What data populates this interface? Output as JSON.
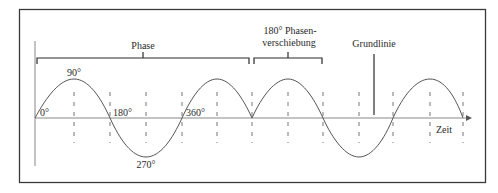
{
  "figure": {
    "type": "sine wave phase diagram",
    "colors": {
      "frame": "#3a3a3a",
      "wave": "#555555",
      "dash": "#666666",
      "text": "#2a2a2a",
      "background": "#ffffff"
    },
    "labels": {
      "phase": "Phase",
      "phase_shift_line1": "180° Phasen-",
      "phase_shift_line2": "verschiebung",
      "baseline": "Grundlinie",
      "time_axis": "Zeit",
      "deg_0": "0°",
      "deg_90": "90°",
      "deg_180": "180°",
      "deg_270": "270°",
      "deg_360": "360°"
    },
    "waves": [
      {
        "name": "first wave",
        "phase_start_deg": 0,
        "cycles": 1.25
      },
      {
        "name": "phase-shifted wave",
        "phase_offset_deg": 180,
        "cycles": 1.5
      }
    ],
    "dashed_marks_x": [
      74,
      110,
      146,
      182,
      217,
      252,
      288,
      323,
      359,
      393,
      430,
      463
    ]
  }
}
